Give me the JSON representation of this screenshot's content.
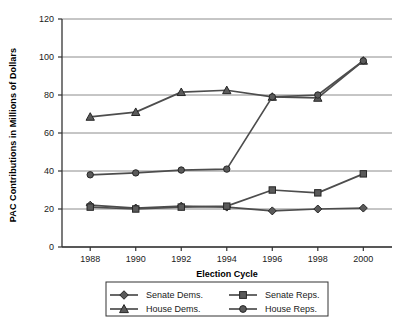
{
  "chart_data": {
    "type": "line",
    "title": "",
    "xlabel": "Election Cycle",
    "ylabel": "PAC Contributions in Millions of Dollars",
    "categories": [
      "1988",
      "1990",
      "1992",
      "1994",
      "1996",
      "1998",
      "2000"
    ],
    "ylim": [
      0,
      120
    ],
    "yticks": [
      "0",
      "20",
      "40",
      "60",
      "80",
      "100",
      "120"
    ],
    "ytick_values": [
      0,
      20,
      40,
      60,
      80,
      100,
      120
    ],
    "grid": "horizontal",
    "legend_position": "bottom",
    "series": [
      {
        "name": "Senate Dems.",
        "marker": "diamond",
        "color": "#4d4d4d",
        "values": [
          22,
          20.5,
          21.5,
          21,
          19,
          20,
          20.5
        ]
      },
      {
        "name": "Senate Reps.",
        "marker": "square",
        "color": "#4d4d4d",
        "values": [
          21,
          20,
          21,
          21.5,
          30,
          28.5,
          38.5
        ]
      },
      {
        "name": "House Dems.",
        "marker": "triangle",
        "color": "#4d4d4d",
        "values": [
          68.5,
          71,
          81.5,
          82.5,
          79,
          78.5,
          98
        ]
      },
      {
        "name": "House Reps.",
        "marker": "circle",
        "color": "#4d4d4d",
        "values": [
          38,
          39,
          40.5,
          41,
          79,
          80,
          98
        ]
      }
    ]
  },
  "legend": {
    "entries": [
      {
        "label": "Senate Dems.",
        "marker": "diamond"
      },
      {
        "label": "Senate Reps.",
        "marker": "square"
      },
      {
        "label": "House Dems.",
        "marker": "triangle"
      },
      {
        "label": "House Reps.",
        "marker": "circle"
      }
    ]
  },
  "colors": {
    "line": "#4d4d4d",
    "marker_fill": "#5a5a5a",
    "marker_stroke": "#262626",
    "grid": "#8c8c8c",
    "axis": "#333333",
    "text": "#1a1a1a",
    "background": "#ffffff"
  }
}
